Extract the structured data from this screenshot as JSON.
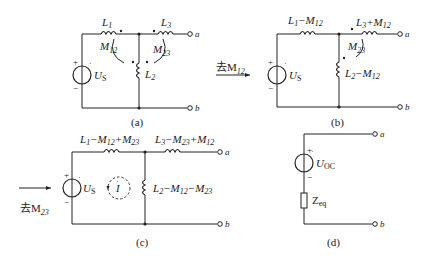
{
  "figure": {
    "panels": [
      {
        "id": "a",
        "caption": "(a)",
        "labels": {
          "L1": "L",
          "L1_sub": "1",
          "L3": "L",
          "L3_sub": "3",
          "L2": "L",
          "L2_sub": "2",
          "M12": "M",
          "M12_sub": "12",
          "M23": "M",
          "M23_sub": "23",
          "source": "U",
          "source_sub": "S",
          "plus": "+",
          "minus": "−",
          "term_a": "a",
          "term_b": "b"
        }
      },
      {
        "id": "b",
        "caption": "(b)",
        "arrow_label": "去M",
        "arrow_label_sub": "12",
        "labels": {
          "L1": "L",
          "L1_sub": "1",
          "L1_rest": "−M",
          "L1_rest_sub": "12",
          "L3": "L",
          "L3_sub": "3",
          "L3_rest": "+M",
          "L3_rest_sub": "12",
          "L2": "L",
          "L2_sub": "2",
          "L2_rest": "−M",
          "L2_rest_sub": "12",
          "M23": "M",
          "M23_sub": "23",
          "source": "U",
          "source_sub": "S",
          "plus": "+",
          "minus": "−",
          "term_a": "a",
          "term_b": "b"
        }
      },
      {
        "id": "c",
        "caption": "(c)",
        "arrow_label": "去M",
        "arrow_label_sub": "23",
        "labels": {
          "L1a": "L",
          "L1a_sub": "1",
          "L1b": "−M",
          "L1b_sub": "12",
          "L1c": "+M",
          "L1c_sub": "23",
          "L3a": "L",
          "L3a_sub": "3",
          "L3b": "−M",
          "L3b_sub": "23",
          "L3c": "+M",
          "L3c_sub": "12",
          "L2a": "L",
          "L2a_sub": "2",
          "L2b": "−M",
          "L2b_sub": "12",
          "L2c": "−M",
          "L2c_sub": "23",
          "source": "U",
          "source_sub": "S",
          "current": "I",
          "plus": "+",
          "minus": "−",
          "term_a": "a",
          "term_b": "b"
        }
      },
      {
        "id": "d",
        "caption": "(d)",
        "labels": {
          "source": "U",
          "source_sub": "OC",
          "impedance": "Z",
          "impedance_sub": "eq",
          "plus": "+",
          "minus": "−",
          "term_a": "a",
          "term_b": "b"
        }
      }
    ]
  }
}
